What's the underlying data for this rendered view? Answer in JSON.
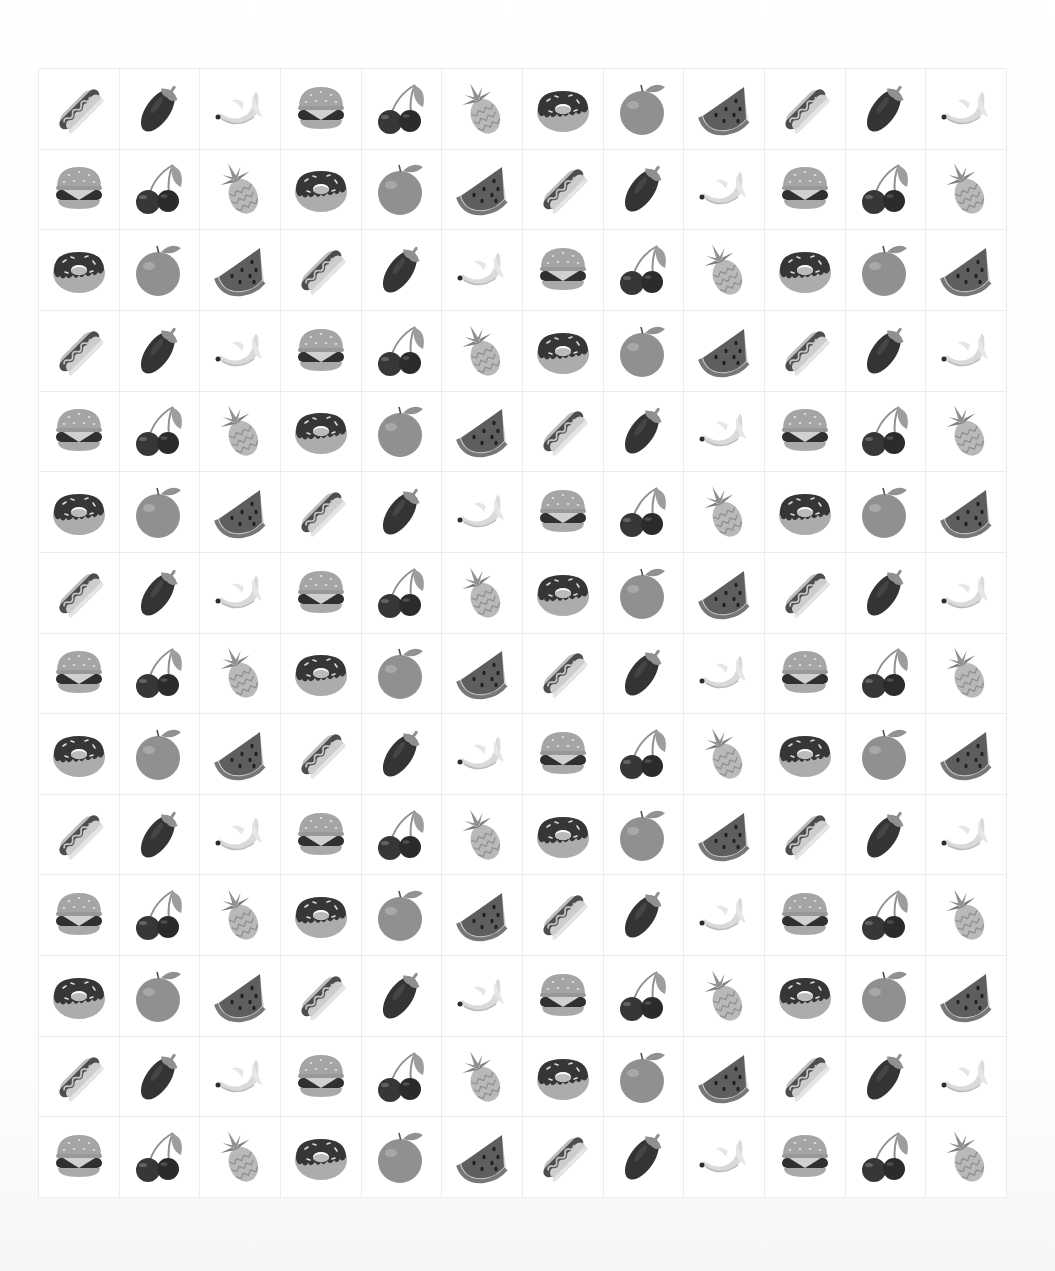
{
  "grid": {
    "columns": 12,
    "rows": 14,
    "sequence": [
      "hotdog",
      "eggplant",
      "banana",
      "burger",
      "cherries",
      "pineapple",
      "donut",
      "orange",
      "watermelon"
    ],
    "cells": [
      [
        "hotdog",
        "eggplant",
        "banana",
        "burger",
        "cherries",
        "pineapple",
        "donut",
        "orange",
        "watermelon",
        "hotdog",
        "eggplant",
        "banana"
      ],
      [
        "burger",
        "cherries",
        "pineapple",
        "donut",
        "orange",
        "watermelon",
        "hotdog",
        "eggplant",
        "banana",
        "burger",
        "cherries",
        "pineapple"
      ],
      [
        "donut",
        "orange",
        "watermelon",
        "hotdog",
        "eggplant",
        "banana",
        "burger",
        "cherries",
        "pineapple",
        "donut",
        "orange",
        "watermelon"
      ],
      [
        "hotdog",
        "eggplant",
        "banana",
        "burger",
        "cherries",
        "pineapple",
        "donut",
        "orange",
        "watermelon",
        "hotdog",
        "eggplant",
        "banana"
      ],
      [
        "burger",
        "cherries",
        "pineapple",
        "donut",
        "orange",
        "watermelon",
        "hotdog",
        "eggplant",
        "banana",
        "burger",
        "cherries",
        "pineapple"
      ],
      [
        "donut",
        "orange",
        "watermelon",
        "hotdog",
        "eggplant",
        "banana",
        "burger",
        "cherries",
        "pineapple",
        "donut",
        "orange",
        "watermelon"
      ],
      [
        "hotdog",
        "eggplant",
        "banana",
        "burger",
        "cherries",
        "pineapple",
        "donut",
        "orange",
        "watermelon",
        "hotdog",
        "eggplant",
        "banana"
      ],
      [
        "burger",
        "cherries",
        "pineapple",
        "donut",
        "orange",
        "watermelon",
        "hotdog",
        "eggplant",
        "banana",
        "burger",
        "cherries",
        "pineapple"
      ],
      [
        "donut",
        "orange",
        "watermelon",
        "hotdog",
        "eggplant",
        "banana",
        "burger",
        "cherries",
        "pineapple",
        "donut",
        "orange",
        "watermelon"
      ],
      [
        "hotdog",
        "eggplant",
        "banana",
        "burger",
        "cherries",
        "pineapple",
        "donut",
        "orange",
        "watermelon",
        "hotdog",
        "eggplant",
        "banana"
      ],
      [
        "burger",
        "cherries",
        "pineapple",
        "donut",
        "orange",
        "watermelon",
        "hotdog",
        "eggplant",
        "banana",
        "burger",
        "cherries",
        "pineapple"
      ],
      [
        "donut",
        "orange",
        "watermelon",
        "hotdog",
        "eggplant",
        "banana",
        "burger",
        "cherries",
        "pineapple",
        "donut",
        "orange",
        "watermelon"
      ],
      [
        "hotdog",
        "eggplant",
        "banana",
        "burger",
        "cherries",
        "pineapple",
        "donut",
        "orange",
        "watermelon",
        "hotdog",
        "eggplant",
        "banana"
      ],
      [
        "burger",
        "cherries",
        "pineapple",
        "donut",
        "orange",
        "watermelon",
        "hotdog",
        "eggplant",
        "banana",
        "burger",
        "cherries",
        "pineapple"
      ]
    ]
  },
  "icons": {
    "hotdog": "hotdog-icon",
    "eggplant": "eggplant-icon",
    "banana": "banana-icon",
    "burger": "burger-icon",
    "cherries": "cherries-icon",
    "pineapple": "pineapple-icon",
    "donut": "donut-icon",
    "orange": "orange-icon",
    "watermelon": "watermelon-icon"
  },
  "colors": {
    "background": "#ffffff",
    "grid_line": "#ececec"
  }
}
